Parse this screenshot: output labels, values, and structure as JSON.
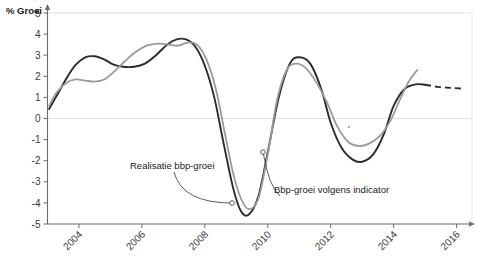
{
  "chart_data": {
    "type": "line",
    "title": "",
    "ylabel": "% Groei",
    "xlabel": "",
    "ylim": [
      -5,
      5
    ],
    "xlim": [
      2003.0,
      2016.3
    ],
    "grid": "horizontal gridlines at 0 and 5 only",
    "legend_position": "inline annotations with leader lines",
    "y_ticks": [
      5,
      4,
      3,
      2,
      1,
      0,
      -1,
      -2,
      -3,
      -4,
      -5
    ],
    "y_tick_labels": [
      "5",
      "4",
      "3",
      "2",
      "1",
      "0",
      "-1",
      "-2",
      "-3",
      "-4",
      "-5"
    ],
    "x_ticks": [
      2004,
      2006,
      2008,
      2010,
      2012,
      2014,
      2016
    ],
    "x_tick_labels": [
      "2004",
      "2006",
      "2008",
      "2010",
      "2012",
      "2014",
      "2016"
    ],
    "series": [
      {
        "name": "Realisatie bbp-groei",
        "color": "#2b2b2b",
        "style": "solid-with-dashed-forecast",
        "x": [
          2003.05,
          2003.3,
          2003.6,
          2003.9,
          2004.2,
          2004.5,
          2004.8,
          2005.1,
          2005.4,
          2005.75,
          2006.1,
          2006.45,
          2006.8,
          2007.1,
          2007.4,
          2007.7,
          2008.0,
          2008.3,
          2008.6,
          2008.9,
          2009.15,
          2009.4,
          2009.7,
          2010.0,
          2010.35,
          2010.7,
          2011.0,
          2011.35,
          2011.7,
          2012.0,
          2012.35,
          2012.7,
          2013.0,
          2013.35,
          2013.7,
          2014.0,
          2014.35,
          2014.7,
          2015.0
        ],
        "y": [
          0.45,
          1.1,
          1.9,
          2.55,
          2.9,
          2.95,
          2.8,
          2.55,
          2.45,
          2.45,
          2.6,
          3.0,
          3.5,
          3.75,
          3.75,
          3.4,
          2.5,
          1.0,
          -1.2,
          -3.3,
          -4.4,
          -4.55,
          -3.7,
          -1.6,
          1.0,
          2.6,
          2.9,
          2.6,
          1.4,
          -0.2,
          -1.4,
          -1.95,
          -2.05,
          -1.7,
          -0.7,
          0.6,
          1.4,
          1.62,
          1.6
        ],
        "forecast_x": [
          2015.0,
          2015.4,
          2015.8,
          2016.2
        ],
        "forecast_y": [
          1.6,
          1.5,
          1.45,
          1.42
        ]
      },
      {
        "name": "Bbp-groei volgens indicator",
        "color": "#9a9a9a",
        "style": "solid",
        "x": [
          2003.05,
          2003.3,
          2003.6,
          2003.9,
          2004.2,
          2004.5,
          2004.8,
          2005.1,
          2005.45,
          2005.8,
          2006.15,
          2006.5,
          2006.85,
          2007.15,
          2007.45,
          2007.75,
          2008.05,
          2008.35,
          2008.65,
          2008.9,
          2009.15,
          2009.4,
          2009.7,
          2010.0,
          2010.3,
          2010.6,
          2010.9,
          2011.2,
          2011.55,
          2011.9,
          2012.2,
          2012.55,
          2012.9,
          2013.2,
          2013.55,
          2013.9,
          2014.2,
          2014.5,
          2014.75
        ],
        "y": [
          0.6,
          1.25,
          1.7,
          1.85,
          1.8,
          1.75,
          1.85,
          2.2,
          2.7,
          3.15,
          3.45,
          3.55,
          3.5,
          3.45,
          3.6,
          3.5,
          2.8,
          1.4,
          -0.8,
          -2.6,
          -3.8,
          -4.3,
          -3.8,
          -1.7,
          0.9,
          2.3,
          2.6,
          2.4,
          1.7,
          0.7,
          -0.35,
          -1.1,
          -1.3,
          -1.2,
          -0.85,
          -0.1,
          0.9,
          1.8,
          2.3
        ]
      }
    ],
    "annotations": [
      {
        "label": "Realisatie bbp-groei",
        "points_to_series": "Realisatie bbp-groei",
        "label_x_px": 130,
        "label_y_px": 169,
        "anchor_x_px": 232,
        "anchor_y_px": 203
      },
      {
        "label": "Bbp-groei volgens indicator",
        "points_to_series": "Bbp-groei volgens indicator",
        "label_x_px": 274,
        "label_y_px": 193,
        "anchor_x_px": 263,
        "anchor_y_px": 152
      }
    ]
  },
  "axis": {
    "y_title": "% Groei"
  }
}
